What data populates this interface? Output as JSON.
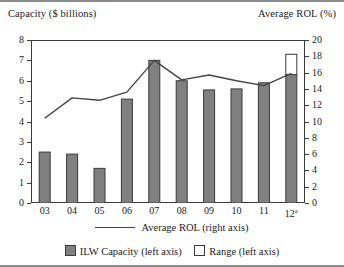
{
  "axis_titles": {
    "left": "Capacity ($ billions)",
    "right": "Average ROL (%)"
  },
  "legend": {
    "line_label": "Average ROL (right axis)",
    "bar_label": "ILW Capacity (left axis)",
    "range_label": "Range (left axis)"
  },
  "colors": {
    "bar_fill": "#808080",
    "bar_stroke": "#3b3b3b",
    "range_fill": "#ffffff",
    "line": "#444444",
    "frame": "#3b3b3b",
    "rule": "#8c8c8c"
  },
  "chart_data": {
    "type": "bar",
    "title": "",
    "xlabel": "",
    "ylabel": "Capacity ($ billions)",
    "y2label": "Average ROL (%)",
    "grid": false,
    "legend_position": "bottom",
    "categories": [
      "03",
      "04",
      "05",
      "06",
      "07",
      "08",
      "09",
      "10",
      "11",
      "12a"
    ],
    "category_labels": [
      "03",
      "04",
      "05",
      "06",
      "07",
      "08",
      "09",
      "10",
      "11",
      "12ᵃ"
    ],
    "ylim": [
      0,
      8
    ],
    "yticks": [
      0,
      1,
      2,
      3,
      4,
      5,
      6,
      7,
      8
    ],
    "y2lim": [
      0,
      20
    ],
    "y2ticks": [
      0,
      2,
      4,
      6,
      8,
      10,
      12,
      14,
      16,
      18,
      20
    ],
    "series": [
      {
        "name": "ILW Capacity (left axis)",
        "type": "bar",
        "axis": "left",
        "unit": "$ billions",
        "values": [
          2.5,
          2.4,
          1.7,
          5.1,
          7.0,
          6.0,
          5.55,
          5.6,
          5.9,
          6.3
        ]
      },
      {
        "name": "Range (left axis)",
        "type": "bar",
        "axis": "left",
        "unit": "$ billions",
        "stacked_on": "ILW Capacity (left axis)",
        "values": [
          null,
          null,
          null,
          null,
          null,
          null,
          null,
          null,
          null,
          1.0
        ],
        "range_top": [
          null,
          null,
          null,
          null,
          null,
          null,
          null,
          null,
          null,
          7.3
        ]
      },
      {
        "name": "Average ROL (right axis)",
        "type": "line",
        "axis": "right",
        "unit": "%",
        "values": [
          10.4,
          12.9,
          12.6,
          13.6,
          17.5,
          15.1,
          15.7,
          15.0,
          14.4,
          15.9
        ]
      }
    ]
  }
}
